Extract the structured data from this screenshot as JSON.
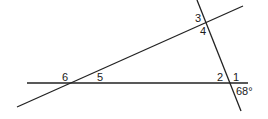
{
  "diagram": {
    "type": "geometry-angles",
    "line_color": "#222222",
    "lines": [
      {
        "name": "horizontal-line",
        "x1": 27,
        "y1": 83,
        "x2": 248,
        "y2": 83
      },
      {
        "name": "long-diagonal-line",
        "x1": 17,
        "y1": 107,
        "x2": 243,
        "y2": 6
      },
      {
        "name": "steep-transversal-line",
        "x1": 197,
        "y1": 0,
        "x2": 241,
        "y2": 111
      }
    ],
    "angle_labels": [
      {
        "id": "3",
        "text": "3",
        "x": 195,
        "y": 13
      },
      {
        "id": "4",
        "text": "4",
        "x": 200,
        "y": 26
      },
      {
        "id": "6",
        "text": "6",
        "x": 62,
        "y": 72
      },
      {
        "id": "5",
        "text": "5",
        "x": 97,
        "y": 72
      },
      {
        "id": "2",
        "text": "2",
        "x": 217,
        "y": 72
      },
      {
        "id": "1",
        "text": "1",
        "x": 233,
        "y": 72
      },
      {
        "id": "given-angle",
        "text": "68°",
        "x": 236,
        "y": 86
      }
    ]
  }
}
